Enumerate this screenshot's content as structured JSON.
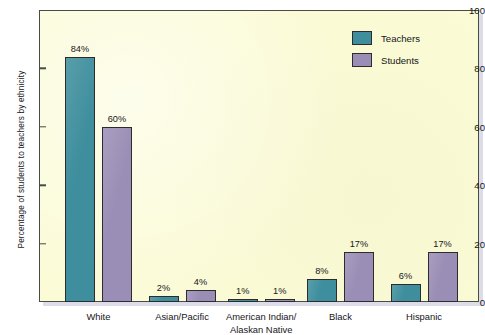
{
  "chart_data": {
    "type": "bar",
    "title": "",
    "xlabel": "",
    "ylabel": "Percentage of students to teachers by ethnicity",
    "ylim": [
      0,
      100
    ],
    "yticks": [
      0,
      20,
      40,
      60,
      80,
      100
    ],
    "grid": false,
    "legend_position": "top-right",
    "categories": [
      "White",
      "Asian/Pacific",
      "American Indian/\nAlaskan Native",
      "Black",
      "Hispanic"
    ],
    "series": [
      {
        "name": "Teachers",
        "color": "#3e8e9d",
        "values": [
          84,
          2,
          1,
          8,
          6
        ],
        "labels": [
          "84%",
          "2%",
          "1%",
          "8%",
          "6%"
        ]
      },
      {
        "name": "Students",
        "color": "#9b8eb6",
        "values": [
          60,
          4,
          1,
          17,
          17
        ],
        "labels": [
          "60%",
          "4%",
          "1%",
          "17%",
          "17%"
        ]
      }
    ]
  },
  "axis": {
    "y_title": "Percentage of students to teachers by ethnicity",
    "y_tick_labels": [
      "0",
      "20",
      "40",
      "60",
      "80",
      "100"
    ]
  },
  "legend": {
    "items": [
      {
        "label": "Teachers",
        "swatch": "teachers"
      },
      {
        "label": "Students",
        "swatch": "students"
      }
    ]
  },
  "colors": {
    "teachers": "#3e8e9d",
    "students": "#9b8eb6",
    "plot_background": "#fbfbd5",
    "frame": "#4a4a46",
    "page_background": "#ffffff",
    "shadow": "#c9cbdc"
  }
}
